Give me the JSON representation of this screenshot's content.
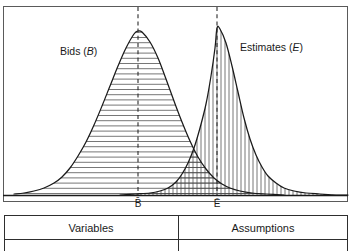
{
  "figure": {
    "title_text": "",
    "chart": {
      "frame": {
        "x": 3,
        "y": 6,
        "width": 345,
        "height": 196
      },
      "baseline_y": 195,
      "labels": {
        "bids": {
          "text": "Bids (B)",
          "name": "Bids",
          "symbol": "B",
          "x": 60,
          "y": 55
        },
        "estimates": {
          "text": "Estimates (E)",
          "name": "Estimates",
          "symbol": "E",
          "x": 240,
          "y": 51
        }
      },
      "axis_ticks": [
        {
          "id": "bids-mean",
          "text": "B̄",
          "plain": "B-bar",
          "x": 138,
          "y": 207
        },
        {
          "id": "estimates-mean",
          "text": "Ē",
          "plain": "E-bar",
          "x": 217,
          "y": 207
        }
      ],
      "mean_lines": [
        {
          "id": "bids-mean-line",
          "x": 138,
          "y1": 7,
          "y2": 196
        },
        {
          "id": "estimates-mean-line",
          "x": 217,
          "y1": 7,
          "y2": 196
        }
      ],
      "colors": {
        "curve": "#1a1a1a",
        "hatch": "#4a4a4a",
        "frame": "#5a5a5a",
        "dash": "#2b2b2b",
        "table_rule": "#2e2e2e",
        "background": "#ffffff"
      }
    },
    "table": {
      "top_y": 215,
      "header_bottom_y": 239,
      "bottom_y": 251,
      "left_x": 4,
      "right_x": 348,
      "divider_x": 178,
      "columns": [
        {
          "id": "variables",
          "header": "Variables",
          "center_x": 91
        },
        {
          "id": "assumptions",
          "header": "Assumptions",
          "center_x": 263
        }
      ]
    }
  },
  "chart_data": {
    "type": "area",
    "xlabel": "",
    "ylabel": "",
    "grid": false,
    "legend_position": "inline-annotation",
    "x_axis": {
      "ticks": [
        "B̄",
        "Ē"
      ],
      "tick_positions_px": [
        138,
        217
      ],
      "range_px": [
        3,
        348
      ]
    },
    "y_axis": {
      "ticks": [],
      "baseline_px": 195
    },
    "annotations": [
      {
        "text": "Bids (B)",
        "x_px": 60,
        "y_px": 55
      },
      {
        "text": "Estimates (E)",
        "x_px": 240,
        "y_px": 51
      }
    ],
    "series": [
      {
        "name": "Bids (B)",
        "symbol": "B",
        "fill_pattern": "horizontal-hatch",
        "mean_label": "B̄",
        "peak_px": {
          "x": 138,
          "y": 31
        },
        "mean_px": 138,
        "spread_px": 36,
        "points_px": [
          [
            14,
            194
          ],
          [
            24,
            193
          ],
          [
            34,
            191
          ],
          [
            44,
            188
          ],
          [
            54,
            183
          ],
          [
            62,
            177
          ],
          [
            70,
            168
          ],
          [
            78,
            156
          ],
          [
            86,
            142
          ],
          [
            94,
            125
          ],
          [
            102,
            106
          ],
          [
            110,
            86
          ],
          [
            118,
            66
          ],
          [
            126,
            48
          ],
          [
            134,
            34
          ],
          [
            138,
            31
          ],
          [
            142,
            32
          ],
          [
            150,
            42
          ],
          [
            158,
            58
          ],
          [
            166,
            79
          ],
          [
            174,
            101
          ],
          [
            182,
            122
          ],
          [
            190,
            141
          ],
          [
            198,
            157
          ],
          [
            206,
            169
          ],
          [
            214,
            178
          ],
          [
            222,
            184
          ],
          [
            230,
            188
          ],
          [
            240,
            191
          ],
          [
            252,
            193
          ],
          [
            266,
            194
          ],
          [
            284,
            195
          ]
        ]
      },
      {
        "name": "Estimates (E)",
        "symbol": "E",
        "fill_pattern": "vertical-hatch",
        "mean_label": "Ē",
        "peak_px": {
          "x": 217,
          "y": 28
        },
        "mean_px": 217,
        "spread_px": 34,
        "points_px": [
          [
            120,
            195
          ],
          [
            136,
            194
          ],
          [
            150,
            193
          ],
          [
            160,
            191
          ],
          [
            168,
            188
          ],
          [
            176,
            182
          ],
          [
            182,
            174
          ],
          [
            188,
            163
          ],
          [
            194,
            148
          ],
          [
            200,
            128
          ],
          [
            206,
            104
          ],
          [
            211,
            76
          ],
          [
            215,
            48
          ],
          [
            217,
            28
          ],
          [
            220,
            29
          ],
          [
            226,
            43
          ],
          [
            232,
            66
          ],
          [
            238,
            92
          ],
          [
            244,
            118
          ],
          [
            250,
            139
          ],
          [
            256,
            155
          ],
          [
            262,
            167
          ],
          [
            268,
            176
          ],
          [
            276,
            183
          ],
          [
            284,
            188
          ],
          [
            294,
            191
          ],
          [
            306,
            193
          ],
          [
            320,
            194
          ],
          [
            336,
            195
          ],
          [
            348,
            195
          ]
        ]
      }
    ],
    "overlap_region": {
      "description": "Region where Bids and Estimates densities overlap, rendered as cross-hatch",
      "x_range_px": [
        120,
        284
      ],
      "fill_pattern": "cross-hatch"
    }
  }
}
